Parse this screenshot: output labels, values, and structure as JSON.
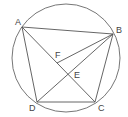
{
  "figure": {
    "type": "cyclic-quadrilateral",
    "stroke_color": "#555555",
    "background": "#ffffff",
    "circle": {
      "cx": 66,
      "cy": 58,
      "r": 54
    },
    "points": {
      "A": {
        "x": 22,
        "y": 27,
        "label": "A"
      },
      "B": {
        "x": 113,
        "y": 34,
        "label": "B"
      },
      "C": {
        "x": 95,
        "y": 102,
        "label": "C"
      },
      "D": {
        "x": 37,
        "y": 102,
        "label": "D"
      },
      "E": {
        "x": 68,
        "y": 74,
        "label": "E"
      },
      "F": {
        "x": 57,
        "y": 63,
        "label": "F"
      }
    },
    "segments": [
      [
        "A",
        "B"
      ],
      [
        "B",
        "C"
      ],
      [
        "C",
        "D"
      ],
      [
        "D",
        "A"
      ],
      [
        "A",
        "C"
      ],
      [
        "B",
        "D"
      ],
      [
        "B",
        "F"
      ]
    ]
  }
}
